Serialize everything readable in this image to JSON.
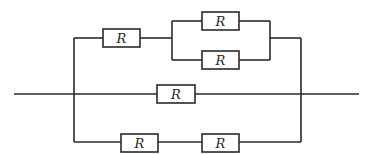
{
  "diagram": {
    "type": "circuit",
    "resistor_label": "R",
    "resistors": [
      {
        "id": "r1",
        "label": "R",
        "branch": "top-series"
      },
      {
        "id": "r2",
        "label": "R",
        "branch": "top-parallel-upper"
      },
      {
        "id": "r3",
        "label": "R",
        "branch": "top-parallel-lower"
      },
      {
        "id": "r4",
        "label": "R",
        "branch": "middle"
      },
      {
        "id": "r5",
        "label": "R",
        "branch": "bottom-left"
      },
      {
        "id": "r6",
        "label": "R",
        "branch": "bottom-right"
      }
    ]
  }
}
